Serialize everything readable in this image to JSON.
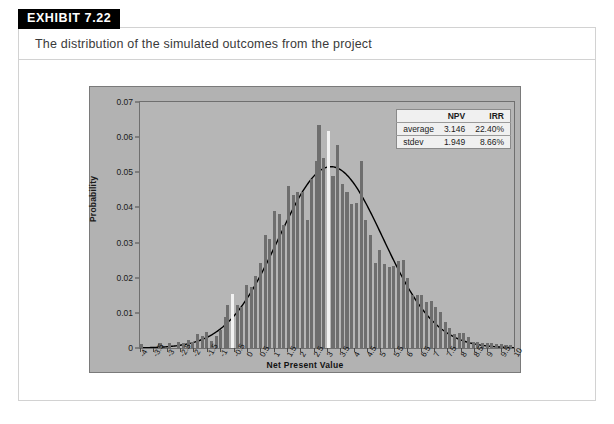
{
  "exhibit": {
    "badge_label": "EXHIBIT 7.22",
    "caption": "The distribution of the simulated outcomes from the project"
  },
  "stats": {
    "col_headers": [
      "",
      "NPV",
      "IRR"
    ],
    "rows": [
      {
        "label": "average",
        "npv": "3.146",
        "irr": "22.40%"
      },
      {
        "label": "stdev",
        "npv": "1.949",
        "irr": "8.66%"
      }
    ]
  },
  "colors": {
    "chart_background": "#b2b2b2",
    "plot_background": "#b6b6b6",
    "bar": "#6e6e6e",
    "bar_highlight": "#f2f2f2",
    "curve": "#000000",
    "frame": "#6f6f6f",
    "badge_background": "#000000",
    "card_border": "#d2d2d2"
  },
  "chart_data": {
    "type": "bar",
    "title": "",
    "xlabel": "Net Present Value",
    "ylabel": "Probability",
    "xlim": [
      -4,
      10
    ],
    "ylim": [
      0,
      0.07
    ],
    "grid": false,
    "legend": "none",
    "ytick_labels": [
      "0",
      "0.01",
      "0.02",
      "0.03",
      "0.04",
      "0.05",
      "0.06",
      "0.07"
    ],
    "ytick_values": [
      0,
      0.01,
      0.02,
      0.03,
      0.04,
      0.05,
      0.06,
      0.07
    ],
    "xtick_labels": [
      "-4",
      "-3.5",
      "-3",
      "-2.5",
      "-2",
      "-1.5",
      "-1",
      "-0.5",
      "0",
      "0.5",
      "1",
      "1.5",
      "2",
      "2.5",
      "3",
      "3.5",
      "4",
      "4.5",
      "5",
      "5.5",
      "6",
      "6.5",
      "7",
      "7.5",
      "8",
      "8.5",
      "9",
      "9.5",
      "10"
    ],
    "xtick_values": [
      -4,
      -3.5,
      -3,
      -2.5,
      -2,
      -1.5,
      -1,
      -0.5,
      0,
      0.5,
      1,
      1.5,
      2,
      2.5,
      3,
      3.5,
      4,
      4.5,
      5,
      5.5,
      6,
      6.5,
      7,
      7.5,
      8,
      8.5,
      9,
      9.5,
      10
    ],
    "bar_width_units": 0.115,
    "highlight_x": [
      -0.54,
      3.05
    ],
    "x": [
      -3.95,
      -3.775,
      -3.6,
      -3.425,
      -3.25,
      -3.075,
      -2.9,
      -2.725,
      -2.55,
      -2.375,
      -2.2,
      -2.025,
      -1.85,
      -1.675,
      -1.5,
      -1.325,
      -1.15,
      -0.975,
      -0.8,
      -0.715,
      -0.54,
      -0.365,
      -0.19,
      -0.015,
      0.16,
      0.335,
      0.51,
      0.685,
      0.86,
      1.035,
      1.21,
      1.385,
      1.56,
      1.735,
      1.91,
      2.085,
      2.26,
      2.435,
      2.61,
      2.7,
      2.875,
      3.05,
      3.225,
      3.4,
      3.575,
      3.75,
      3.925,
      4.1,
      4.275,
      4.45,
      4.625,
      4.8,
      4.975,
      5.15,
      5.325,
      5.5,
      5.675,
      5.85,
      6.025,
      6.2,
      6.375,
      6.55,
      6.725,
      6.9,
      7.075,
      7.25,
      7.425,
      7.6,
      7.775,
      7.95,
      8.125,
      8.3,
      8.475,
      8.65,
      8.825,
      9.0,
      9.175,
      9.35,
      9.525,
      9.7,
      9.875
    ],
    "values": [
      0.0012,
      0,
      0,
      0,
      0.0013,
      0,
      0.0014,
      0,
      0.0016,
      0.0014,
      0.0022,
      0.0018,
      0.004,
      0.0034,
      0.0045,
      0.0021,
      0.0035,
      0.0052,
      0.0088,
      0.0122,
      0.0153,
      0.0123,
      0.0118,
      0.0179,
      0.0175,
      0.0205,
      0.0243,
      0.0321,
      0.031,
      0.0391,
      0.0381,
      0.035,
      0.0462,
      0.0434,
      0.0443,
      0.0445,
      0.0363,
      0.0482,
      0.0532,
      0.0635,
      0.0542,
      0.0618,
      0.0489,
      0.0579,
      0.0466,
      0.0443,
      0.0409,
      0.0413,
      0.0533,
      0.0363,
      0.0322,
      0.0243,
      0.028,
      0.024,
      0.0231,
      0.0234,
      0.0249,
      0.0251,
      0.0198,
      0.0152,
      0.0151,
      0.015,
      0.0131,
      0.0133,
      0.0118,
      0.0102,
      0.0074,
      0.0057,
      0.0039,
      0.0043,
      0.0043,
      0.003,
      0.0018,
      0.0016,
      0.0015,
      0.0015,
      0.0013,
      0.0012,
      0.0011,
      0.001,
      0.0009
    ],
    "overlay_curve": {
      "type": "normal_pdf",
      "mean": 3.146,
      "stdev": 1.949,
      "peak_value": 0.0516,
      "color": "#000000"
    }
  }
}
